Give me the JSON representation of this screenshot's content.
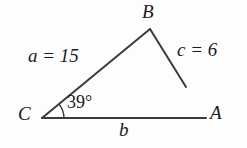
{
  "figure": {
    "background_color": "#fdfdfd",
    "stroke_color": "#3b3b3b",
    "text_color": "#1a1a1a"
  },
  "vertices": [
    {
      "name": "B",
      "label": "B",
      "x": 150,
      "y": 29
    },
    {
      "name": "C",
      "label": "C",
      "x": 42,
      "y": 118
    },
    {
      "name": "A",
      "label": "A",
      "x": 206,
      "y": 118
    }
  ],
  "segments": [
    {
      "name": "side-a",
      "from": "C",
      "to": "B",
      "x1": 42,
      "y1": 118,
      "x2": 150,
      "y2": 29
    },
    {
      "name": "side-c",
      "from": "B",
      "to": "open",
      "x1": 150,
      "y1": 29,
      "x2": 186,
      "y2": 87
    },
    {
      "name": "side-b",
      "from": "C",
      "to": "A",
      "x1": 42,
      "y1": 118,
      "x2": 206,
      "y2": 118
    }
  ],
  "side_labels": {
    "a": "a = 15",
    "c": "c = 6",
    "b": "b"
  },
  "angle": {
    "vertex": "C",
    "label": "39°",
    "degrees": 39,
    "arc_radius": 22
  }
}
